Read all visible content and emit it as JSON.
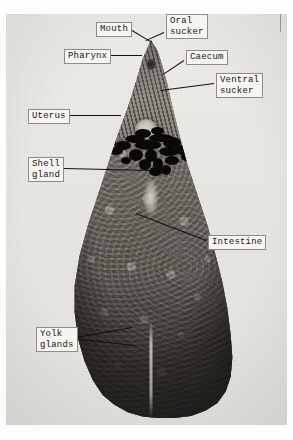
{
  "figure": {
    "plate_background_color": "#eceae6",
    "label_box_color": "#f6f5f2",
    "label_text_color": "#16150f",
    "leader_line_color": "#111111"
  },
  "labels": [
    {
      "id": "mouth",
      "text": "Mouth",
      "x": 96,
      "y": 22
    },
    {
      "id": "oral-sucker",
      "text": "Oral\nsucker",
      "x": 166,
      "y": 14
    },
    {
      "id": "pharynx",
      "text": "Pharynx",
      "x": 64,
      "y": 49
    },
    {
      "id": "caecum",
      "text": "Caecum",
      "x": 186,
      "y": 50
    },
    {
      "id": "ventral-sucker",
      "text": "Ventral\nsucker",
      "x": 216,
      "y": 73
    },
    {
      "id": "uterus",
      "text": "Uterus",
      "x": 28,
      "y": 109
    },
    {
      "id": "shell-gland",
      "text": "Shell\ngland",
      "x": 28,
      "y": 157
    },
    {
      "id": "intestine",
      "text": "Intestine",
      "x": 208,
      "y": 235
    },
    {
      "id": "yolk-glands",
      "text": "Yolk\nglands",
      "x": 36,
      "y": 327
    }
  ],
  "leaders": [
    {
      "id": "mouth",
      "x1": 132,
      "y1": 30,
      "x2": 152,
      "y2": 42
    },
    {
      "id": "oral-sucker",
      "x1": 164,
      "y1": 32,
      "x2": 146,
      "y2": 40
    },
    {
      "id": "pharynx",
      "x1": 110,
      "y1": 55,
      "x2": 142,
      "y2": 55
    },
    {
      "id": "caecum",
      "x1": 184,
      "y1": 60,
      "x2": 163,
      "y2": 74
    },
    {
      "id": "ventral-sucker",
      "x1": 214,
      "y1": 83,
      "x2": 160,
      "y2": 90
    },
    {
      "id": "uterus",
      "x1": 68,
      "y1": 115,
      "x2": 121,
      "y2": 115
    },
    {
      "id": "shell-gland",
      "x1": 64,
      "y1": 168,
      "x2": 152,
      "y2": 170
    },
    {
      "id": "intestine",
      "x1": 206,
      "y1": 240,
      "x2": 136,
      "y2": 213
    },
    {
      "id": "yolk-glands-a",
      "x1": 76,
      "y1": 337,
      "x2": 132,
      "y2": 327
    },
    {
      "id": "yolk-glands-b",
      "x1": 76,
      "y1": 339,
      "x2": 136,
      "y2": 345
    }
  ],
  "uterus_coils": [
    {
      "x": 30,
      "y": 2,
      "w": 16,
      "h": 9
    },
    {
      "x": 46,
      "y": 0,
      "w": 13,
      "h": 8
    },
    {
      "x": 20,
      "y": 8,
      "w": 20,
      "h": 8
    },
    {
      "x": 44,
      "y": 7,
      "w": 24,
      "h": 8
    },
    {
      "x": 10,
      "y": 14,
      "w": 16,
      "h": 9
    },
    {
      "x": 30,
      "y": 13,
      "w": 26,
      "h": 10
    },
    {
      "x": 58,
      "y": 10,
      "w": 18,
      "h": 11
    },
    {
      "x": 4,
      "y": 20,
      "w": 14,
      "h": 8
    },
    {
      "x": 24,
      "y": 22,
      "w": 14,
      "h": 12
    },
    {
      "x": 40,
      "y": 22,
      "w": 12,
      "h": 13
    },
    {
      "x": 54,
      "y": 20,
      "w": 20,
      "h": 9
    },
    {
      "x": 70,
      "y": 18,
      "w": 14,
      "h": 10
    },
    {
      "x": 34,
      "y": 32,
      "w": 12,
      "h": 11
    },
    {
      "x": 48,
      "y": 31,
      "w": 10,
      "h": 12
    },
    {
      "x": 60,
      "y": 29,
      "w": 14,
      "h": 9
    },
    {
      "x": 16,
      "y": 30,
      "w": 10,
      "h": 7
    },
    {
      "x": 44,
      "y": 40,
      "w": 13,
      "h": 9
    },
    {
      "x": 56,
      "y": 38,
      "w": 10,
      "h": 10
    },
    {
      "x": 76,
      "y": 26,
      "w": 11,
      "h": 8
    },
    {
      "x": 2,
      "y": 12,
      "w": 9,
      "h": 7
    }
  ]
}
